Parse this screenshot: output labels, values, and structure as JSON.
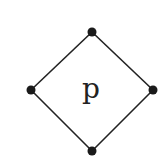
{
  "diagram": {
    "type": "diamond-lattice",
    "center_label": "p",
    "colors": {
      "background": "#ffffff",
      "stroke": "#222222",
      "node_fill": "#1a1a1a",
      "label": "#222222"
    },
    "nodes": [
      {
        "id": "top",
        "x": 92,
        "y": 32
      },
      {
        "id": "right",
        "x": 153,
        "y": 90
      },
      {
        "id": "bottom",
        "x": 92,
        "y": 151
      },
      {
        "id": "left",
        "x": 31,
        "y": 90
      }
    ],
    "edges": [
      [
        "top",
        "right"
      ],
      [
        "right",
        "bottom"
      ],
      [
        "bottom",
        "left"
      ],
      [
        "left",
        "top"
      ]
    ]
  }
}
